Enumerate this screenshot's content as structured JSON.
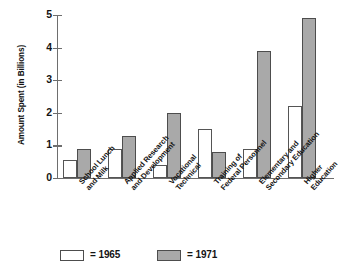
{
  "chart_data": {
    "type": "bar",
    "title": "",
    "xlabel": "",
    "ylabel": "Amount Spent (in Billions)",
    "ylim": [
      0,
      5
    ],
    "yticks": [
      "0",
      "1",
      "2",
      "3",
      "4",
      "5"
    ],
    "grid": false,
    "legend_position": "bottom-left",
    "categories": [
      "School Lunch and Milk",
      "Applied Research and Development",
      "Vocational Technical",
      "Training of Federal Personnel",
      "Elementary and Secondary Education",
      "Higher Education"
    ],
    "category_lines": [
      [
        "School Lunch",
        "and Milk"
      ],
      [
        "Applied Research",
        "and Development"
      ],
      [
        "Vocational",
        "Technical"
      ],
      [
        "Training of",
        "Federal Personnel"
      ],
      [
        "Elementary and",
        "Secondary Education"
      ],
      [
        "Higher",
        "Education"
      ]
    ],
    "series": [
      {
        "name": "1965",
        "legend_label": "= 1965",
        "color": "#ffffff",
        "values": [
          0.55,
          0.9,
          0.4,
          1.5,
          0.9,
          2.2
        ]
      },
      {
        "name": "1971",
        "legend_label": "= 1971",
        "color": "#a9a9a9",
        "values": [
          0.9,
          1.3,
          2.0,
          0.8,
          3.9,
          4.9
        ]
      }
    ]
  },
  "colors": {
    "bar_1965_fill": "#ffffff",
    "bar_1971_fill": "#a9a9a9",
    "bar_border": "#4d4d4d",
    "axis": "#6e6e6e",
    "text": "#141414",
    "background": "#ffffff"
  }
}
